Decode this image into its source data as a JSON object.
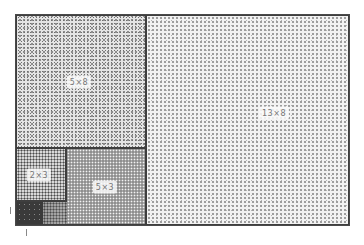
{
  "diagram": {
    "type": "fibonacci-rectangle-tiling",
    "tiles": [
      {
        "id": "tile-5x8",
        "label": "5×8"
      },
      {
        "id": "tile-13x8",
        "label": "13×8"
      },
      {
        "id": "tile-2x3",
        "label": "2×3"
      },
      {
        "id": "tile-5x3",
        "label": "5×3"
      },
      {
        "id": "tile-dark-corner",
        "label": ""
      }
    ]
  }
}
